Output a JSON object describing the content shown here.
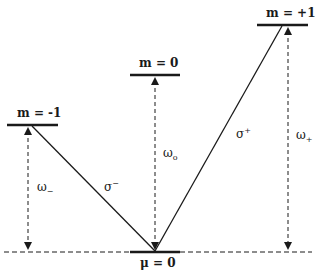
{
  "diagram": {
    "type": "energy-level diagram",
    "levels": [
      {
        "id": "m-minus-1",
        "label": "m = -1"
      },
      {
        "id": "m-0",
        "label": "m = 0"
      },
      {
        "id": "m-plus-1",
        "label": "m = +1"
      },
      {
        "id": "ground",
        "label": "μ = 0"
      }
    ],
    "transitions": [
      {
        "id": "sigma-minus",
        "label": "σ",
        "sup": "−"
      },
      {
        "id": "sigma-plus",
        "label": "σ",
        "sup": "+"
      }
    ],
    "frequencies": [
      {
        "id": "omega-minus",
        "label": "ω",
        "sub": "−"
      },
      {
        "id": "omega-0",
        "label": "ω",
        "sub": "o"
      },
      {
        "id": "omega-plus",
        "label": "ω",
        "sub": "+"
      }
    ],
    "colors": {
      "line": "#1a1a1a",
      "background": "#ffffff"
    }
  }
}
